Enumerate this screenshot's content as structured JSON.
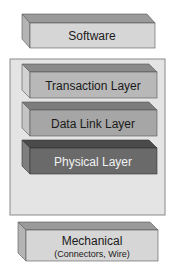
{
  "diagram": {
    "software": {
      "label": "Software",
      "front": "#d6d6d6",
      "top": "#9a9a9a",
      "side": "#b4b4b4",
      "text": "#1a1a1a"
    },
    "container": {
      "fill": "#e4e4e4",
      "stroke": "#8a8a8a"
    },
    "layers": [
      {
        "label": "Transaction Layer",
        "front": "#b8b8b8",
        "top": "#8a8a8a",
        "side": "#d2d2d2",
        "text": "#1a1a1a"
      },
      {
        "label": "Data Link Layer",
        "front": "#a6a6a6",
        "top": "#7c7c7c",
        "side": "#c4c4c4",
        "text": "#1a1a1a"
      },
      {
        "label": "Physical Layer",
        "front": "#6a6a6a",
        "top": "#4a4a4a",
        "side": "#7e7e7e",
        "text": "#f2f2f2"
      }
    ],
    "mechanical": {
      "label": "Mechanical",
      "sublabel": "(Connectors, Wire)",
      "front": "#d6d6d6",
      "top": "#9a9a9a",
      "side": "#b4b4b4",
      "text": "#1a1a1a"
    }
  }
}
